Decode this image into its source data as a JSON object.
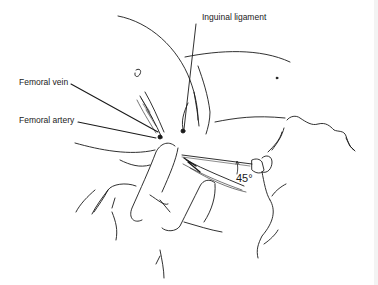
{
  "figure": {
    "labels": {
      "inguinal_ligament": "Inguinal ligament",
      "femoral_vein": "Femoral vein",
      "femoral_artery": "Femoral artery",
      "needle_angle": "45°"
    },
    "colors": {
      "line": "#1a1a1a",
      "background": "#ffffff"
    }
  }
}
